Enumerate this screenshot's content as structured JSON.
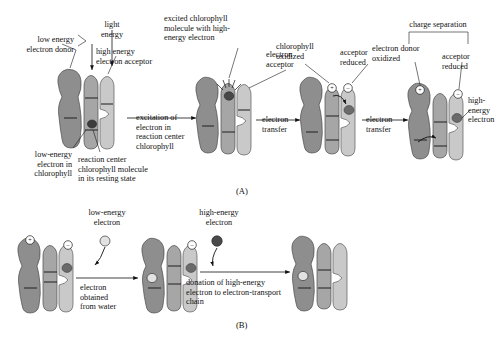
{
  "figure": {
    "panel_a_label": "(A)",
    "panel_b_label": "(B)"
  },
  "panel_a": {
    "labels": {
      "light_energy": "light\nenergy",
      "low_energy_electron_donor": "low energy\nelectron donor",
      "high_energy_electron_acceptor": "high energy\nelectron acceptor",
      "low_energy_electron_in_chlorophyll": "low-energy\nelectron in\nchlorophyll",
      "reaction_center_resting": "reaction center\nchlorophyll molecule\nin its resting state",
      "excited_chlorophyll": "excited chlorophyll\nmolecule with high-\nenergy electron",
      "electron_acceptor": "electron\nacceptor",
      "chlorophyll_oxidized": "chlorophyll\noxidized",
      "acceptor_reduced": "acceptor\nreduced",
      "charge_separation": "charge separation",
      "electron_donor_oxidized": "electron donor\noxidized",
      "acceptor_reduced_2": "acceptor\nreduced",
      "high_energy_electron": "high-\nenergy\nelectron"
    },
    "arrows": [
      {
        "id": "excitation",
        "caption": "excitation of\nelectron in\nreaction center\nchlorophyll"
      },
      {
        "id": "transfer-1",
        "caption": "electron\ntransfer"
      },
      {
        "id": "transfer-2",
        "caption": "electron\ntransfer"
      }
    ],
    "charges": [
      {
        "id": "chlorophyll-plus",
        "symbol": "+"
      },
      {
        "id": "acceptor-minus",
        "symbol": "–"
      },
      {
        "id": "donor-plus",
        "symbol": "+"
      },
      {
        "id": "acceptor-minus-2",
        "symbol": "–"
      }
    ]
  },
  "panel_b": {
    "labels": {
      "low_energy_electron": "low-energy\nelectron",
      "high_energy_electron": "high-energy\nelectron"
    },
    "arrows": [
      {
        "id": "water-donation",
        "caption": "electron\nobtained\nfrom water"
      },
      {
        "id": "etc-donation",
        "caption": "donation of high-energy\nelectron to electron-transport\nchain"
      }
    ],
    "charges": [
      {
        "id": "donor-plus-b",
        "symbol": "+"
      },
      {
        "id": "acceptor-minus-b",
        "symbol": "–"
      },
      {
        "id": "donor-plus-b2",
        "symbol": "+"
      },
      {
        "id": "acceptor-minus-b2",
        "symbol": "–"
      }
    ]
  },
  "colors": {
    "donor_subunit": "#8e8e8e",
    "chlorophyll_subunit": "#a6a6a6",
    "acceptor_subunit": "#c9c9c9",
    "low_energy_electron": "#e2e2e2",
    "high_energy_electron": "#4a4a4a",
    "background": "#ffffff"
  }
}
